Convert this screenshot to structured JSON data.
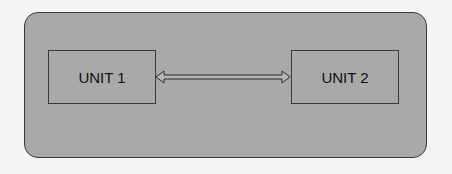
{
  "diagram": {
    "frame": {
      "fill": "#a9a9a9",
      "stroke": "#3a3a3a"
    },
    "units": [
      {
        "label": "UNIT 1"
      },
      {
        "label": "UNIT 2"
      }
    ],
    "connector": {
      "type": "bidirectional-hollow-arrow",
      "from": "UNIT 1",
      "to": "UNIT 2"
    }
  }
}
